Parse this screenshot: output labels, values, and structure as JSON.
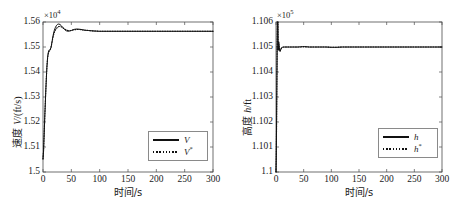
{
  "figure": {
    "width": 456,
    "height": 208,
    "background": "#ffffff",
    "line_color": "#111111",
    "axis_color": "#4d4d4d"
  },
  "chart_data": [
    {
      "type": "line",
      "id": "velocity",
      "title": "",
      "xlabel": "时间/s",
      "ylabel_cn": "速度",
      "ylabel_var": "V",
      "ylabel_unit": "/(ft/s)",
      "y_exponent_text": "×10",
      "y_exponent_sup": "4",
      "y_multiplier": 10000,
      "xlim": [
        0,
        300
      ],
      "ylim": [
        1.5,
        1.56
      ],
      "xticks": [
        0,
        50,
        100,
        150,
        200,
        250,
        300
      ],
      "xtick_labels": [
        "0",
        "50",
        "100",
        "150",
        "200",
        "250",
        "300"
      ],
      "yticks": [
        1.5,
        1.51,
        1.52,
        1.53,
        1.54,
        1.55,
        1.56
      ],
      "ytick_labels": [
        "1.5",
        "1.51",
        "1.52",
        "1.53",
        "1.54",
        "1.55",
        "1.56"
      ],
      "grid": false,
      "legend_position": "lower-right",
      "series": [
        {
          "name": "V",
          "name_sup": "",
          "style": "solid",
          "x": [
            0,
            1,
            2,
            3,
            4,
            5,
            6,
            7,
            8,
            9,
            10,
            11,
            12,
            13,
            14,
            15,
            16,
            18,
            20,
            22,
            24,
            26,
            28,
            30,
            32,
            35,
            38,
            41,
            44,
            47,
            50,
            53,
            56,
            60,
            65,
            70,
            75,
            80,
            90,
            100,
            120,
            150,
            200,
            250,
            300
          ],
          "y": [
            1.5052,
            1.5085,
            1.5148,
            1.5212,
            1.5272,
            1.5328,
            1.538,
            1.5424,
            1.5455,
            1.5474,
            1.5484,
            1.5488,
            1.549,
            1.5492,
            1.5497,
            1.5508,
            1.5522,
            1.5548,
            1.5567,
            1.5579,
            1.5587,
            1.5591,
            1.5592,
            1.559,
            1.5586,
            1.5578,
            1.557,
            1.5565,
            1.5563,
            1.5564,
            1.5566,
            1.5569,
            1.5571,
            1.5572,
            1.5571,
            1.5569,
            1.5567,
            1.5566,
            1.5564,
            1.5563,
            1.5563,
            1.5563,
            1.5563,
            1.5563,
            1.5563
          ]
        },
        {
          "name": "V",
          "name_sup": "*",
          "style": "dotted",
          "x": [
            0,
            1,
            2,
            3,
            4,
            5,
            6,
            7,
            8,
            9,
            10,
            11,
            12,
            13,
            14,
            15,
            16,
            18,
            20,
            22,
            24,
            26,
            28,
            30,
            32,
            35,
            38,
            41,
            44,
            47,
            50,
            53,
            56,
            60,
            65,
            70,
            75,
            80,
            90,
            100,
            120,
            150,
            200,
            250,
            300
          ],
          "y": [
            1.5052,
            1.5085,
            1.5148,
            1.5212,
            1.5272,
            1.5328,
            1.538,
            1.5424,
            1.5453,
            1.547,
            1.5479,
            1.5483,
            1.5486,
            1.549,
            1.5497,
            1.5509,
            1.5521,
            1.5543,
            1.5558,
            1.5568,
            1.5575,
            1.5579,
            1.5582,
            1.5582,
            1.5581,
            1.5577,
            1.5572,
            1.5568,
            1.5566,
            1.5565,
            1.5566,
            1.5568,
            1.5569,
            1.557,
            1.557,
            1.5568,
            1.5567,
            1.5566,
            1.5564,
            1.5563,
            1.5563,
            1.5563,
            1.5563,
            1.5563,
            1.5563
          ]
        }
      ]
    },
    {
      "type": "line",
      "id": "altitude",
      "title": "",
      "xlabel": "时间/s",
      "ylabel_cn": "高度",
      "ylabel_var": "h",
      "ylabel_unit": "/ft",
      "y_exponent_text": "×10",
      "y_exponent_sup": "5",
      "y_multiplier": 100000,
      "xlim": [
        0,
        300
      ],
      "ylim": [
        1.1,
        1.106
      ],
      "xticks": [
        0,
        50,
        100,
        150,
        200,
        250,
        300
      ],
      "xtick_labels": [
        "0",
        "50",
        "100",
        "150",
        "200",
        "250",
        "300"
      ],
      "yticks": [
        1.1,
        1.101,
        1.102,
        1.103,
        1.104,
        1.105,
        1.106
      ],
      "ytick_labels": [
        "1.1",
        "1.101",
        "1.102",
        "1.103",
        "1.104",
        "1.105",
        "1.106"
      ],
      "grid": false,
      "legend_position": "lower-right",
      "series": [
        {
          "name": "h",
          "name_sup": "",
          "style": "solid",
          "x": [
            0,
            0.5,
            1,
            1.5,
            2,
            2.5,
            3,
            3.5,
            4,
            4.5,
            5,
            5.5,
            6,
            6.5,
            7,
            7.5,
            8,
            9,
            10,
            11,
            12,
            14,
            16,
            18,
            20,
            24,
            28,
            32,
            36,
            40,
            44,
            48,
            52,
            56,
            60,
            70,
            80,
            90,
            100,
            110,
            120,
            140,
            160,
            200,
            250,
            300
          ],
          "y": [
            1.1,
            1.1006,
            1.1018,
            1.1033,
            1.1048,
            1.1062,
            1.1073,
            1.1082,
            1.10487,
            1.1051,
            1.10521,
            1.10512,
            1.10498,
            1.10488,
            1.10483,
            1.10483,
            1.10486,
            1.10492,
            1.10496,
            1.10498,
            1.10499,
            1.105,
            1.105,
            1.105,
            1.105,
            1.105,
            1.105,
            1.105,
            1.105,
            1.105,
            1.10501,
            1.10502,
            1.10502,
            1.10501,
            1.105,
            1.105,
            1.105,
            1.105,
            1.10499,
            1.10499,
            1.105,
            1.105,
            1.105,
            1.105,
            1.105,
            1.105
          ]
        },
        {
          "name": "h",
          "name_sup": "*",
          "style": "dotted",
          "x": [
            0,
            0.5,
            1,
            1.5,
            2,
            2.5,
            3,
            3.5,
            4,
            4.5,
            5,
            5.5,
            6,
            6.5,
            7,
            7.5,
            8,
            9,
            10,
            11,
            12,
            14,
            16,
            18,
            20,
            24,
            28,
            32,
            36,
            40,
            44,
            48,
            52,
            56,
            60,
            70,
            80,
            90,
            100,
            110,
            120,
            140,
            160,
            200,
            250,
            300
          ],
          "y": [
            1.1,
            1.1006,
            1.1018,
            1.1033,
            1.1048,
            1.1062,
            1.1073,
            1.1082,
            1.10487,
            1.105,
            1.10512,
            1.10506,
            1.10496,
            1.10488,
            1.10484,
            1.10484,
            1.10487,
            1.10492,
            1.10496,
            1.10498,
            1.10499,
            1.105,
            1.105,
            1.105,
            1.105,
            1.105,
            1.105,
            1.105,
            1.105,
            1.105,
            1.105,
            1.105,
            1.105,
            1.105,
            1.105,
            1.105,
            1.105,
            1.105,
            1.10499,
            1.10499,
            1.105,
            1.105,
            1.105,
            1.105,
            1.105,
            1.105
          ]
        }
      ]
    }
  ]
}
